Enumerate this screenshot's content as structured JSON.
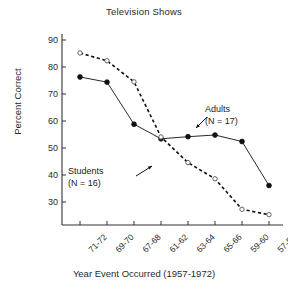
{
  "chart_data": {
    "type": "line",
    "title": "Television Shows",
    "xlabel": "Year Event Occurred (1957-1972)",
    "ylabel": "Percent Correct",
    "categories": [
      "71-72",
      "69-70",
      "67-68",
      "61-62",
      "63-64",
      "65-66",
      "59-60",
      "57-58"
    ],
    "yticks": [
      30,
      40,
      50,
      60,
      70,
      80,
      90
    ],
    "ylim": [
      22,
      90
    ],
    "grid": false,
    "legend_position": "inline-annotations",
    "series": [
      {
        "name": "Adults",
        "n_label": "(N = 17)",
        "marker": "filled-circle",
        "linestyle": "solid",
        "color": "#111111",
        "values": [
          76.3,
          74.4,
          58.8,
          53.4,
          54.2,
          54.8,
          52.4,
          36.1
        ]
      },
      {
        "name": "Students",
        "n_label": "(N = 16)",
        "marker": "open-circle",
        "linestyle": "dashed",
        "color": "#111111",
        "values": [
          85.2,
          82.3,
          74.5,
          54.1,
          44.6,
          38.6,
          27.3,
          25.3
        ]
      }
    ],
    "annotations": [
      {
        "text": "Adults",
        "sub": "(N = 17)",
        "points_to": "adults-series"
      },
      {
        "text": "Students",
        "sub": "(N = 16)",
        "points_to": "students-series"
      }
    ]
  },
  "axis": {
    "ytick_labels": [
      "90",
      "80",
      "70",
      "60",
      "50",
      "40",
      "30"
    ],
    "xtick_labels": [
      "71-72",
      "69-70",
      "67-68",
      "61-62",
      "63-64",
      "65-66",
      "59-60",
      "57-58"
    ]
  },
  "annotations": {
    "adults": {
      "name": "Adults",
      "n": "(N = 17)"
    },
    "students": {
      "name": "Students",
      "n": "(N = 16)"
    }
  }
}
